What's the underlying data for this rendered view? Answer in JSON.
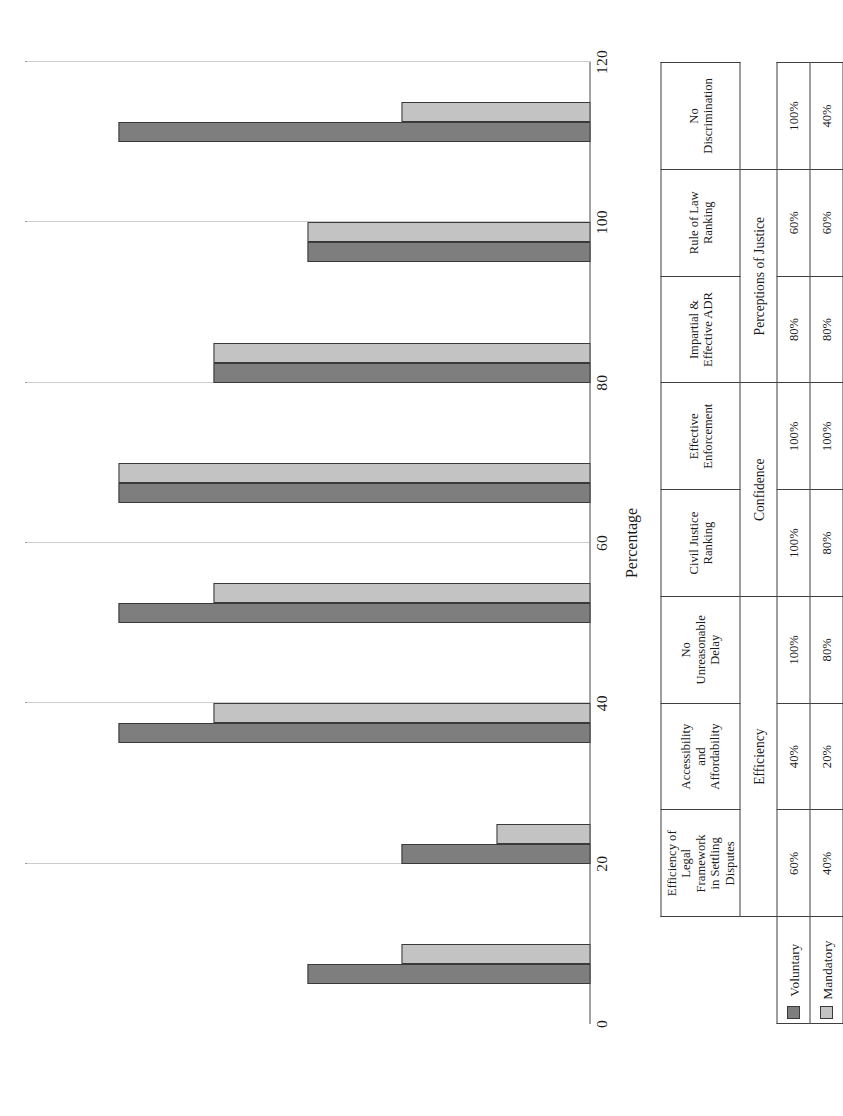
{
  "chart_data": {
    "type": "bar",
    "orientation": "horizontal-rotated",
    "title": "",
    "xlabel": "",
    "ylabel": "Percentage",
    "ylim": [
      0,
      120
    ],
    "yticks": [
      0,
      20,
      40,
      60,
      80,
      100,
      120
    ],
    "grid": true,
    "legend_position": "bottom-left-table",
    "categories": [
      "Efficiency of Legal Framework in Settling Disputes",
      "Accessibility and Affordability",
      "No Unreasonable Delay",
      "Civil Justice Ranking",
      "Effective Enforcement",
      "Impartial & Effective ADR",
      "Rule of Law Ranking",
      "No Discrimination"
    ],
    "series": [
      {
        "name": "Voluntary",
        "color": "#7e7e7e",
        "values": [
          60,
          40,
          100,
          100,
          100,
          80,
          60,
          100
        ]
      },
      {
        "name": "Mandatory",
        "color": "#c3c3c3",
        "values": [
          40,
          20,
          80,
          80,
          100,
          80,
          60,
          40
        ]
      }
    ]
  },
  "axis": {
    "value_axis_title": "Percentage",
    "ticks": [
      "0",
      "20",
      "40",
      "60",
      "80",
      "100",
      "120"
    ]
  },
  "table": {
    "category_labels": [
      "Efficiency of\nLegal\nFramework\nin Settling\nDisputes",
      "Accessibility\nand\nAffordability",
      "No\nUnreasonable\nDelay",
      "Civil Justice\nRanking",
      "Effective\nEnforcement",
      "Impartial &\nEffective ADR",
      "Rule of Law\nRanking",
      "No\nDiscrimination"
    ],
    "groups": [
      {
        "label": "Efficiency",
        "span": 3
      },
      {
        "label": "Confidence",
        "span": 2
      },
      {
        "label": "Perceptions of Justice",
        "span": 2
      }
    ],
    "rows": [
      {
        "label": "Voluntary",
        "swatch": "voluntary",
        "values": [
          "60%",
          "40%",
          "100%",
          "100%",
          "100%",
          "80%",
          "60%",
          "100%"
        ]
      },
      {
        "label": "Mandatory",
        "swatch": "mandatory",
        "values": [
          "40%",
          "20%",
          "80%",
          "80%",
          "100%",
          "80%",
          "60%",
          "40%"
        ]
      }
    ]
  },
  "colors": {
    "voluntary": "#7e7e7e",
    "mandatory": "#c3c3c3",
    "border": "#3f3f3f",
    "gridline": "#9a9a9a"
  }
}
